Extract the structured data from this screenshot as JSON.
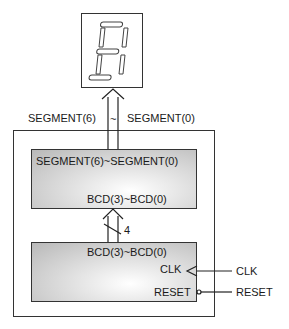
{
  "display": {
    "digit": "8",
    "type": "seven-segment"
  },
  "bus_out": {
    "label_left": "SEGMENT(6)",
    "tilde": "~",
    "label_right": "SEGMENT(0)"
  },
  "decoder_block": {
    "output_label": "SEGMENT(6)~SEGMENT(0)",
    "input_label": "BCD(3)~BCD(0)"
  },
  "bus_mid": {
    "width_label": "4"
  },
  "counter_block": {
    "output_label": "BCD(3)~BCD(0)",
    "clk_pin": "CLK",
    "reset_pin": "RESET"
  },
  "external": {
    "clk": "CLK",
    "reset": "RESET"
  }
}
